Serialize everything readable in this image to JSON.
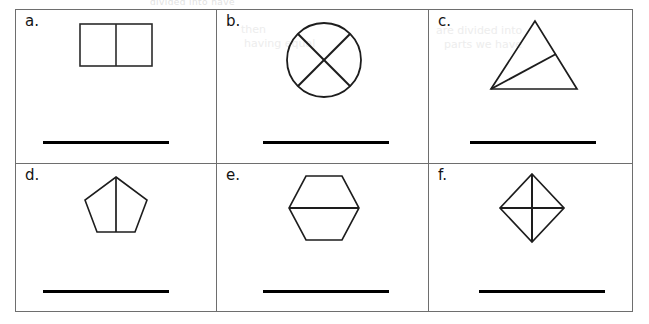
{
  "page": {
    "background_color": "#ffffff",
    "border_color": "#6e6e6e",
    "ink_color": "#141414",
    "answer_line_color": "#000000",
    "ghost_top_text": "divided into         have"
  },
  "table": {
    "columns": 3,
    "rows": 2,
    "cells": [
      {
        "id": "a",
        "label": "a.",
        "shape": "rectangle",
        "shape_name": "rectangle-split-into-2",
        "parts": 2,
        "answer_line": true
      },
      {
        "id": "b",
        "label": "b.",
        "shape": "circle",
        "shape_name": "circle-split-into-4",
        "parts": 4,
        "answer_line": true
      },
      {
        "id": "c",
        "label": "c.",
        "shape": "triangle",
        "shape_name": "triangle-split-into-2",
        "parts": 2,
        "answer_line": true
      },
      {
        "id": "d",
        "label": "d.",
        "shape": "pentagon",
        "shape_name": "pentagon-split-into-2",
        "parts": 2,
        "answer_line": true
      },
      {
        "id": "e",
        "label": "e.",
        "shape": "hexagon",
        "shape_name": "hexagon-split-into-2",
        "parts": 2,
        "answer_line": true
      },
      {
        "id": "f",
        "label": "f.",
        "shape": "rhombus",
        "shape_name": "rhombus-split-into-4",
        "parts": 4,
        "answer_line": true
      }
    ]
  },
  "bleedthrough": [
    {
      "text": "are divided into",
      "x": 448,
      "y": 24
    },
    {
      "text": "parts we have",
      "x": 455,
      "y": 38
    },
    {
      "text": "then",
      "x": 243,
      "y": 22
    },
    {
      "text": "having equal",
      "x": 248,
      "y": 36
    }
  ]
}
